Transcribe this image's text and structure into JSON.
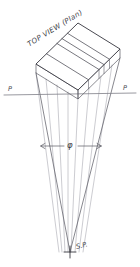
{
  "drawing": {
    "title": "TOP VIEW (Plan)",
    "type": "perspective-construction-diagram",
    "labels": {
      "picture_plane_left": "P",
      "picture_plane_right": "P",
      "angle_symbol": "φ",
      "station_point": "S.P."
    },
    "colors": {
      "background": "#ffffff",
      "ink": "#3d3d44",
      "ink_light": "#9a9aa2",
      "ink_mid": "#6e6e76"
    },
    "geometry": {
      "picture_plane_line": {
        "x1": 4,
        "y1": 95,
        "x2": 136,
        "y2": 93
      },
      "station_point": {
        "x": 70,
        "y": 252
      },
      "block_corners": {
        "front_left": {
          "x": 36,
          "y": 64
        },
        "front_right": {
          "x": 78,
          "y": 90
        },
        "back_right": {
          "x": 120,
          "y": 49
        },
        "back_left": {
          "x": 78,
          "y": 23
        }
      },
      "block_depth_offset": {
        "dx": 0,
        "dy": 9
      },
      "division_count": 4,
      "angle_arc_y": 146,
      "angle_arrow_left_x": 42,
      "angle_arrow_right_x": 100
    }
  }
}
